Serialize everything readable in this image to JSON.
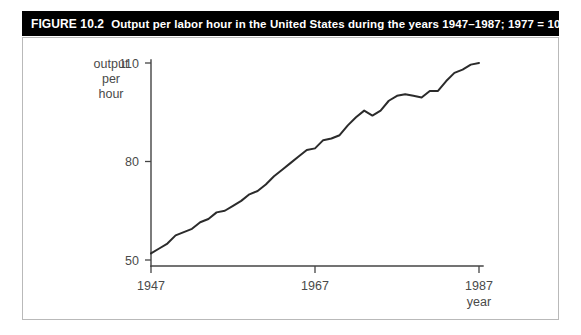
{
  "figure": {
    "label": "FIGURE 10.2",
    "caption": "Output per labor hour in the United States during the years 1947–1987; 1977 = 100.",
    "bar_color": "#000000",
    "bar_text_color": "#ffffff",
    "frame_color": "#b9b9b9"
  },
  "chart_data": {
    "type": "line",
    "title": "Output per labor hour in the United States during the years 1947–1987; 1977 = 100.",
    "xlabel": "year",
    "ylabel": "output per hour",
    "ylabel_lines": [
      "output",
      "per",
      "hour"
    ],
    "xlim": [
      1947,
      1987
    ],
    "ylim": [
      50,
      110
    ],
    "yticks": [
      50,
      80,
      110
    ],
    "ytick_labels": [
      "50",
      "80",
      "110"
    ],
    "xticks": [
      1947,
      1967,
      1987
    ],
    "xtick_labels": [
      "1947",
      "1967",
      "1987"
    ],
    "grid": false,
    "legend": false,
    "line_color": "#2b2b2b",
    "series": [
      {
        "name": "Output per labor hour (1977 = 100)",
        "x": [
          1947,
          1948,
          1949,
          1950,
          1951,
          1952,
          1953,
          1954,
          1955,
          1956,
          1957,
          1958,
          1959,
          1960,
          1961,
          1962,
          1963,
          1964,
          1965,
          1966,
          1967,
          1968,
          1969,
          1970,
          1971,
          1972,
          1973,
          1974,
          1975,
          1976,
          1977,
          1978,
          1979,
          1980,
          1981,
          1982,
          1983,
          1984,
          1985,
          1986,
          1987
        ],
        "values": [
          52.0,
          53.5,
          55.0,
          57.5,
          58.5,
          59.5,
          61.5,
          62.5,
          64.5,
          65.0,
          66.5,
          68.0,
          70.0,
          71.0,
          73.0,
          75.5,
          77.5,
          79.5,
          81.5,
          83.5,
          84.0,
          86.5,
          87.0,
          88.0,
          91.0,
          93.5,
          95.5,
          94.0,
          95.5,
          98.5,
          100.0,
          100.5,
          100.0,
          99.5,
          101.5,
          101.5,
          104.5,
          107.0,
          108.0,
          109.5,
          110.0
        ]
      }
    ]
  }
}
